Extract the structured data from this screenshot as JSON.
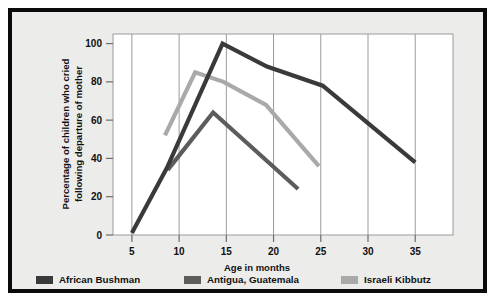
{
  "figure": {
    "background_color": "#ececeb",
    "border_color": "#0a0a0a",
    "plot_background_color": "#ffffff"
  },
  "chart_data": {
    "type": "line",
    "title": "",
    "subtitle": "",
    "xlabel": "Age in months",
    "ylabel": "Percentage of children who cried\nfollowing departure of mother",
    "ylabel_line1": "Percentage of children who cried",
    "ylabel_line2": "following departure of mother",
    "xlim": [
      3,
      39
    ],
    "ylim": [
      0,
      105
    ],
    "xticks": [
      5,
      10,
      15,
      20,
      25,
      30,
      35
    ],
    "xtick_labels": [
      "5",
      "10",
      "15",
      "20",
      "25",
      "30",
      "35"
    ],
    "yticks": [
      0,
      20,
      40,
      60,
      80,
      100
    ],
    "ytick_labels": [
      "0",
      "20",
      "40",
      "60",
      "80",
      "100"
    ],
    "grid": "vertical",
    "grid_color": "#9a9a9a",
    "legend_position": "below",
    "series": [
      {
        "name": "African Bushman",
        "color": "#3a3a3a",
        "x": [
          5,
          8.7,
          14.6,
          19.3,
          25.2,
          35
        ],
        "y": [
          1,
          35,
          100,
          88,
          78,
          38
        ]
      },
      {
        "name": "Antigua, Guatemala",
        "color": "#5c5c5c",
        "x": [
          8.8,
          13.6,
          22.6
        ],
        "y": [
          34,
          64,
          24
        ]
      },
      {
        "name": "Israeli Kibbutz",
        "color": "#a9a9a9",
        "x": [
          8.5,
          11.7,
          14.7,
          19.2,
          24.8
        ],
        "y": [
          52,
          85,
          80,
          68,
          36
        ]
      }
    ]
  },
  "legend": {
    "items": [
      {
        "label": "African Bushman",
        "color": "#3a3a3a"
      },
      {
        "label": "Antigua, Guatemala",
        "color": "#5c5c5c"
      },
      {
        "label": "Israeli Kibbutz",
        "color": "#a9a9a9"
      }
    ]
  }
}
